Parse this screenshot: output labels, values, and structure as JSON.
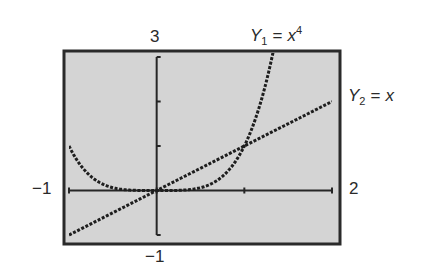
{
  "chart_data": {
    "type": "line",
    "title": "",
    "window": {
      "xmin": -1,
      "xmax": 2,
      "ymin": -1,
      "ymax": 3
    },
    "xlim": [
      -1,
      2
    ],
    "ylim": [
      -1,
      3
    ],
    "grid": false,
    "background": "#d4d4d4",
    "frame_color": "#2a2a2a",
    "tick_labels": {
      "ymax": "3",
      "ymin": "−1",
      "xmin": "−1",
      "xmax": "2"
    },
    "series": [
      {
        "name": "Y1",
        "label": "Y₁ = x⁴",
        "expr": "x^4",
        "style": "dotted",
        "x": [
          -1,
          -0.75,
          -0.5,
          -0.25,
          0,
          0.25,
          0.5,
          0.75,
          1,
          1.1,
          1.2,
          1.3
        ],
        "values": [
          1,
          0.316,
          0.0625,
          0.0039,
          0,
          0.0039,
          0.0625,
          0.316,
          1,
          1.464,
          2.074,
          2.856
        ]
      },
      {
        "name": "Y2",
        "label": "Y₂ = x",
        "expr": "x",
        "style": "dotted",
        "x": [
          -1,
          0,
          1,
          2
        ],
        "values": [
          -1,
          0,
          1,
          2
        ]
      }
    ],
    "intersections": [
      {
        "x": 0,
        "y": 0
      },
      {
        "x": 1,
        "y": 1
      }
    ]
  },
  "labels": {
    "y1_name": "Y",
    "y1_sub": "1",
    "y1_eq": "=",
    "y1_base": "x",
    "y1_exp": "4",
    "y2_name": "Y",
    "y2_sub": "2",
    "y2_eq": "=",
    "y2_rhs": "x"
  }
}
